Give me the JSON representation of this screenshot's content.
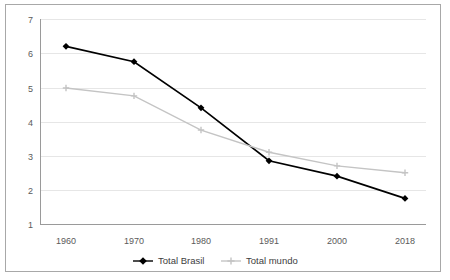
{
  "chart_data": {
    "type": "line",
    "title": "",
    "xlabel": "",
    "ylabel": "",
    "categories": [
      "1960",
      "1970",
      "1980",
      "1991",
      "2000",
      "2018"
    ],
    "x": [
      1960,
      1970,
      1980,
      1991,
      2000,
      2018
    ],
    "ylim": [
      1,
      7
    ],
    "yticks": [
      1,
      2,
      3,
      4,
      5,
      6,
      7
    ],
    "ytick_labels": [
      "1",
      "2",
      "3",
      "4",
      "5",
      "6",
      "7"
    ],
    "grid": true,
    "grid_axis": "y",
    "legend_position": "bottom",
    "series": [
      {
        "name": "Total Brasil",
        "color": "#000000",
        "marker": "diamond",
        "values": [
          6.2,
          5.75,
          4.4,
          2.85,
          2.4,
          1.75
        ]
      },
      {
        "name": "Total mundo",
        "color": "#c4c4c4",
        "marker": "plus",
        "values": [
          4.98,
          4.75,
          3.75,
          3.1,
          2.7,
          2.5
        ]
      }
    ]
  },
  "axis": {
    "y_tick_7": "7",
    "y_tick_6": "6",
    "y_tick_5": "5",
    "y_tick_4": "4",
    "y_tick_3": "3",
    "y_tick_2": "2",
    "y_tick_1": "1",
    "x_tick_1960": "1960",
    "x_tick_1970": "1970",
    "x_tick_1980": "1980",
    "x_tick_1991": "1991",
    "x_tick_2000": "2000",
    "x_tick_2018": "2018"
  },
  "legend": {
    "items": [
      {
        "label": "Total Brasil",
        "color": "#000000"
      },
      {
        "label": "Total mundo",
        "color": "#c4c4c4"
      }
    ]
  },
  "colors": {
    "brasil": "#000000",
    "mundo": "#c4c4c4",
    "grid": "#e6e6e6",
    "frame": "#a8a8a8",
    "tick_label": "#5a5a5a"
  }
}
